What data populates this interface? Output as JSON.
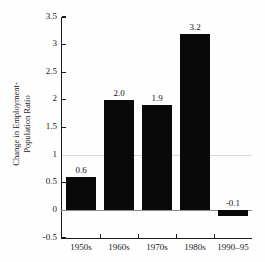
{
  "figure": {
    "title_cropped": "FIGURE 1.1",
    "background_color": "#fefefe",
    "bar_color": "#090909",
    "axis_color": "#1b1b1b",
    "zero_line_color": "#8a8a8a",
    "grid_color": "#d8d8d8"
  },
  "chart_data": {
    "type": "bar",
    "title": "FIGURE 1.1",
    "categories": [
      "1950s",
      "1960s",
      "1970s",
      "1980s",
      "1990–95"
    ],
    "values": [
      0.6,
      2.0,
      1.9,
      3.2,
      -0.1
    ],
    "data_labels": [
      "0.6",
      "2.0",
      "1.9",
      "3.2",
      "-0.1"
    ],
    "xlabel": "",
    "ylabel": "Change in Employment-Population Ratio",
    "ylabel_line1": "Change in Employment-",
    "ylabel_line2": "Population Ratio",
    "ylim": [
      -0.5,
      3.5
    ],
    "ytick_values": [
      3.5,
      3.0,
      2.5,
      2.0,
      1.5,
      1.0,
      0.5,
      0.0,
      -0.5
    ],
    "ytick_labels": [
      "3.5",
      "3",
      "2.5",
      "2",
      "1.5",
      "1",
      "0.5",
      "0",
      "-0.5"
    ],
    "gridlines_at": [
      1.0
    ],
    "zero_line": 0.0,
    "grid": false,
    "legend": "none"
  }
}
